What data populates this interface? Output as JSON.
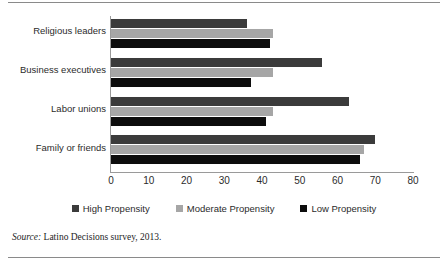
{
  "chart_data": {
    "type": "bar",
    "orientation": "horizontal",
    "title": "",
    "xlabel": "",
    "ylabel": "",
    "xlim": [
      0,
      80
    ],
    "xticks": [
      0,
      10,
      20,
      30,
      40,
      50,
      60,
      70,
      80
    ],
    "grid": false,
    "legend_position": "bottom",
    "categories": [
      "Religious leaders",
      "Business executives",
      "Labor unions",
      "Family or friends"
    ],
    "series": [
      {
        "name": "High Propensity",
        "color": "#3b3b3b",
        "values": [
          36,
          56,
          63,
          70
        ]
      },
      {
        "name": "Moderate Propensity",
        "color": "#a6a6a6",
        "values": [
          43,
          43,
          43,
          67
        ]
      },
      {
        "name": "Low Propensity",
        "color": "#0d0d0d",
        "values": [
          42,
          37,
          41,
          66
        ]
      }
    ]
  },
  "legend": {
    "items": [
      {
        "label": "High Propensity",
        "color": "#3b3b3b"
      },
      {
        "label": "Moderate Propensity",
        "color": "#a6a6a6"
      },
      {
        "label": "Low Propensity",
        "color": "#0d0d0d"
      }
    ]
  },
  "source": {
    "prefix": "Source:",
    "text": " Latino Decisions survey, 2013."
  }
}
